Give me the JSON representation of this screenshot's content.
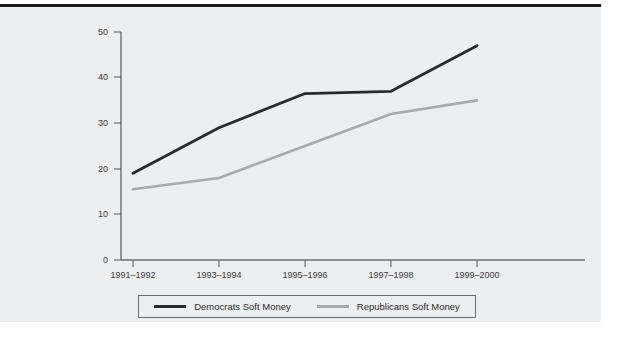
{
  "chart_data": {
    "type": "line",
    "title": "",
    "xlabel": "",
    "ylabel": "",
    "categories": [
      "1991–1992",
      "1993–1994",
      "1995–1996",
      "1997–1998",
      "1999–2000"
    ],
    "series": [
      {
        "name": "Democrats Soft Money",
        "color": "#2a2a2e",
        "values": [
          19,
          29,
          36.5,
          37,
          47
        ]
      },
      {
        "name": "Republicans Soft Money",
        "color": "#a9aaae",
        "values": [
          15.5,
          18,
          25,
          32,
          35
        ]
      }
    ],
    "ylim": [
      0,
      50
    ],
    "yticks": [
      0,
      10,
      20,
      30,
      40,
      50
    ],
    "ytick_labels": [
      "0",
      "10",
      "20",
      "30",
      "40",
      "50"
    ],
    "grid": false,
    "legend_position": "bottom"
  },
  "legend": {
    "entries": [
      {
        "label": "Democrats Soft Money",
        "color": "#2a2a2e"
      },
      {
        "label": "Republicans Soft Money",
        "color": "#a9aaae"
      }
    ]
  },
  "axis": {
    "y_ticks": [
      "50",
      "40",
      "30",
      "20",
      "10",
      "0"
    ],
    "x_ticks": [
      "1991–1992",
      "1993–1994",
      "1995–1996",
      "1997–1998",
      "1999–2000"
    ]
  },
  "colors": {
    "panel_background": "#edeef0",
    "page_background": "#ffffff",
    "axis_line": "#6e6e72",
    "democrats_line": "#2a2a2e",
    "republicans_line": "#a9aaae",
    "legend_border": "#6e6e72",
    "top_rule": "#1a1a1a"
  }
}
